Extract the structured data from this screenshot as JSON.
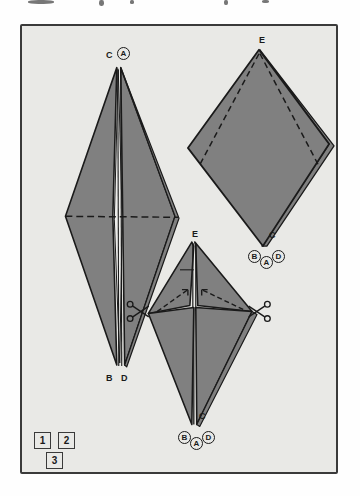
{
  "page": {
    "background_color": "#fefefe",
    "panel_background_color": "#e9e9e6",
    "panel_border_color": "#3a3a3a",
    "shape_fill_color": "#808080",
    "shape_stroke_color": "#1a1a1a",
    "highlight_fill_color": "#ececea"
  },
  "figures": {
    "left": {
      "name": "step-1-folded-diamond",
      "labels": {
        "apex_plain": "C",
        "apex_circled": "A",
        "bottom_left": "B",
        "bottom_right": "D"
      }
    },
    "upper_right": {
      "name": "step-2-kite",
      "labels": {
        "apex": "E",
        "inner": "C",
        "circled_left": "B",
        "circled_center": "A",
        "circled_right": "D"
      }
    },
    "bottom_middle": {
      "name": "step-3-cut-diamond",
      "labels": {
        "apex": "E",
        "inner": "C",
        "circled_left": "B",
        "circled_center": "A",
        "circled_right": "D"
      },
      "tools": {
        "left_scissors": "scissors-icon",
        "right_scissors": "scissors-icon"
      }
    }
  },
  "step_badges": [
    {
      "label": "1"
    },
    {
      "label": "2"
    },
    {
      "label": "3"
    }
  ]
}
